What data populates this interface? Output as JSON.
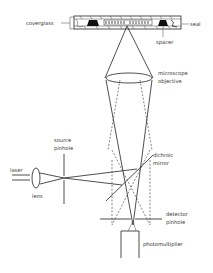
{
  "diagram": {
    "labels": {
      "coverglass": "coverglass",
      "seal": "seal",
      "spacer": "spacer",
      "objective_line1": "microscope",
      "objective_line2": "objective",
      "source_pinhole_line1": "source",
      "source_pinhole_line2": "pinhole",
      "laser": "laser",
      "lens": "lens",
      "dichroic_line1": "dichroic",
      "dichroic_line2": "mirror",
      "detector_pinhole_line1": "detector",
      "detector_pinhole_line2": "pinhole",
      "photomultiplier": "photomultiplier"
    },
    "colors": {
      "line": "#222222",
      "background": "#ffffff",
      "fill_dark": "#111111"
    }
  }
}
